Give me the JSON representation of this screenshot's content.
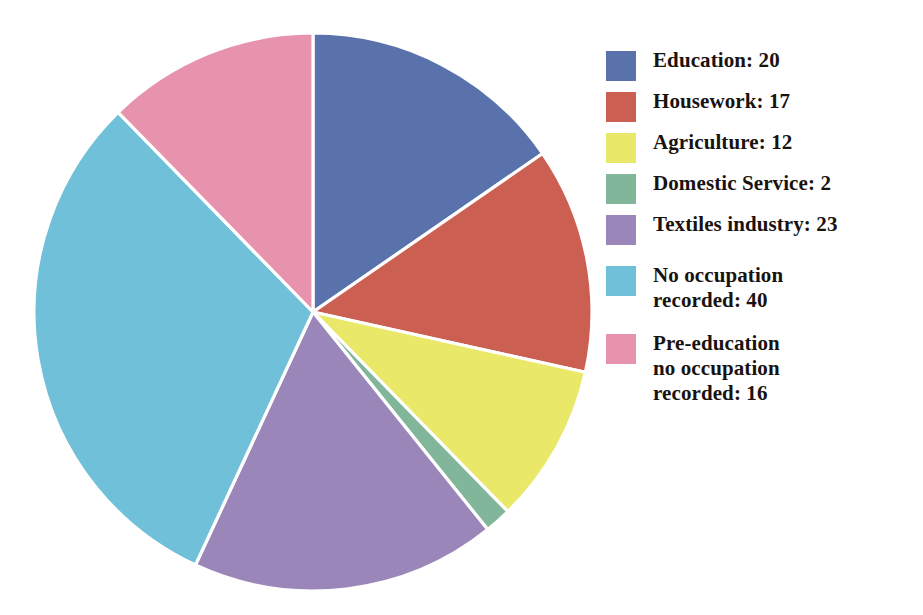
{
  "chart_data": {
    "type": "pie",
    "title": "",
    "subtitle": "",
    "xlabel": "",
    "ylabel": "",
    "total": 130,
    "start_angle_deg": 0,
    "direction": "clockwise",
    "legend_position": "right",
    "grid": false,
    "slice_separator_color": "#ffffff",
    "background_color": "#ffffff",
    "categories": [
      "Education",
      "Housework",
      "Agriculture",
      "Domestic Service",
      "Textiles industry",
      "No occupation recorded",
      "Pre-education no occupation recorded"
    ],
    "values": [
      20,
      17,
      12,
      2,
      23,
      40,
      16
    ],
    "colors": [
      "#5a72ac",
      "#cb5f52",
      "#eae868",
      "#82b69b",
      "#9a86b8",
      "#6fc0d8",
      "#e893ad"
    ],
    "labels": [
      "Education: 20",
      "Housework: 17",
      "Agriculture: 12",
      "Domestic Service: 2",
      "Textiles industry: 23",
      "No occupation\nrecorded: 40",
      "Pre-education\nno occupation\nrecorded: 16"
    ]
  },
  "legend": {
    "items": [
      {
        "label": "Education: 20",
        "color": "#5a72ac",
        "value": 20,
        "name": "Education"
      },
      {
        "label": "Housework: 17",
        "color": "#cb5f52",
        "value": 17,
        "name": "Housework"
      },
      {
        "label": "Agriculture: 12",
        "color": "#eae868",
        "value": 12,
        "name": "Agriculture"
      },
      {
        "label": "Domestic Service: 2",
        "color": "#82b69b",
        "value": 2,
        "name": "Domestic Service"
      },
      {
        "label": "Textiles industry: 23",
        "color": "#9a86b8",
        "value": 23,
        "name": "Textiles industry"
      },
      {
        "label": "No occupation\nrecorded: 40",
        "color": "#6fc0d8",
        "value": 40,
        "name": "No occupation recorded"
      },
      {
        "label": "Pre-education\nno occupation\nrecorded: 16",
        "color": "#e893ad",
        "value": 16,
        "name": "Pre-education no occupation recorded"
      }
    ]
  }
}
